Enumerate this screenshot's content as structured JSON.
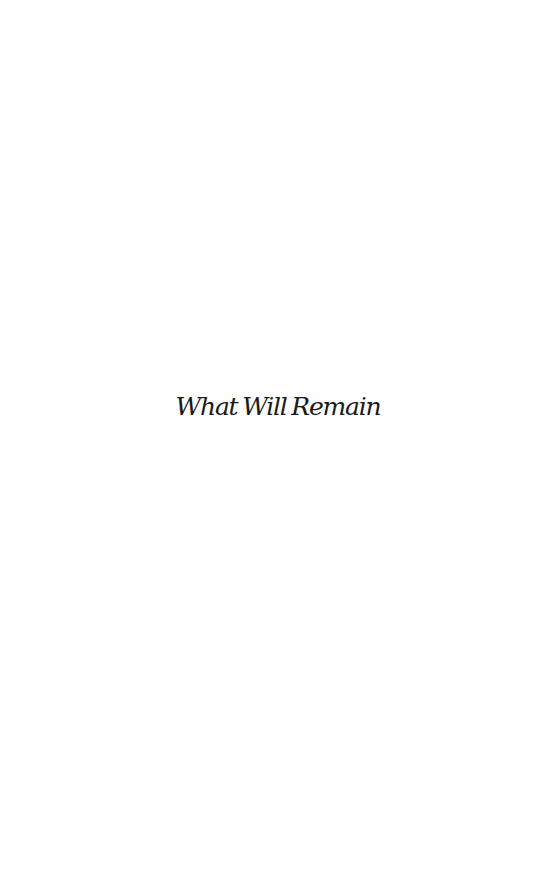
{
  "page": {
    "type": "half-title",
    "title": "What Will Remain",
    "colors": {
      "background": "#ffffff",
      "text": "#1a1a1a"
    }
  }
}
